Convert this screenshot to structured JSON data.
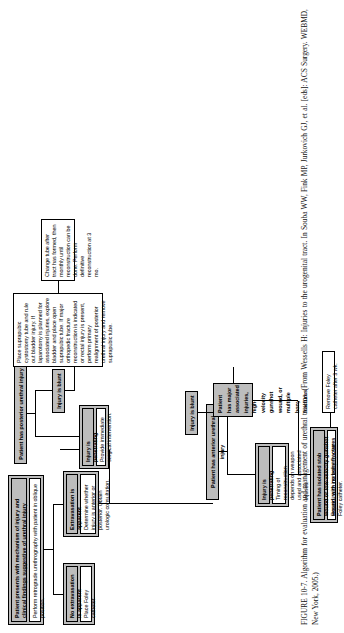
{
  "figure": {
    "label": "FIGURE 10-7.",
    "caption_main": "Algorithm for evaluation and management of urethral trauma.",
    "caption_source": "(From Wessells H: Injuries to the urogenital tract. In Souba WW, Fink MP, Jurkovich GJ, et al. [eds]: ACS Surgery. WEBMD, New York, 2005.)",
    "caption_full": "FIGURE 10-7. Algorithm for evaluation and management of urethral trauma. (From Wessells H: Injuries to the urogenital tract. In Souba WW, Fink MP, Jurkovich GJ, et al. [eds]: ACS Surgery. WEBMD, New York, 2005.)"
  },
  "colors": {
    "header_fill": "#bdbdbd",
    "body_fill": "#ffffff",
    "stroke": "#000000"
  },
  "nodes": {
    "root": {
      "header": "Patient presents with mechanism of injury and clinical findings suggestive of urethral injury",
      "body": "Perform retrograde urethrography with patient in oblique position."
    },
    "no_extrav": {
      "header": "No extravasation is apparent",
      "body": "Place Foley catheter."
    },
    "extrav": {
      "header": "Extravasation is apparent",
      "body": "Determine whether injury is anterior or posterior. Obtain urologic consultation."
    },
    "anterior": {
      "header": "Patient has anterior urethral injury"
    },
    "posterior": {
      "header": "Patient has posterior urethral injury"
    },
    "ant_penetrating": {
      "header": "Injury is penetrating",
      "body": "Timing of reconstruction depends on weapon used and associated injuries."
    },
    "ant_blunt": {
      "header": "Injury is blunt"
    },
    "stab": {
      "header": "Patient has isolated stab wound or low-velocity gunshot wound, with no bony fractures",
      "body": "Repair injury immediately over Foley catheter."
    },
    "major": {
      "header": "Patient has major associated injuries, high-velocity gunshot wound, or multiple bony fractures"
    },
    "remove_foley": {
      "body": "Remove Foley catheter after 3 wk."
    },
    "post_penetrating": {
      "header": "Injury is penetrating",
      "body": "Provide immediate surgical intervention."
    },
    "post_blunt": {
      "header": "Injury is blunt"
    },
    "suprapubic": {
      "body": "Place suprapubic cystostomy tube and rule out bladder injury. If laparotomy is planned for associated injuries, explore bladder and place open suprapubic tube. If major orthopedic fracture reconstruction is indicated or rectal injury is present, perform primary realignment of posterior urethral injury and remove suprapubic tube."
    },
    "change_tube": {
      "body": "Change tube after tract has formed, then monthly until reconstruction can be done. Perform definitive reconstruction at 3 mo."
    }
  }
}
